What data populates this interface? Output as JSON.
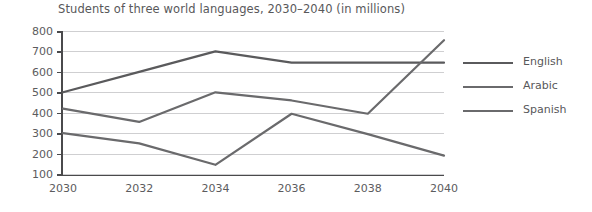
{
  "chart_data": {
    "type": "line",
    "title": "Students of three world languages, 2030–2040 (in millions)",
    "xlabel": "",
    "ylabel": "",
    "categories": [
      "2030",
      "2032",
      "2034",
      "2036",
      "2038",
      "2040"
    ],
    "x": [
      2030,
      2032,
      2034,
      2036,
      2038,
      2040
    ],
    "ylim": [
      100,
      800
    ],
    "yticks": [
      100,
      200,
      300,
      400,
      500,
      600,
      700,
      800
    ],
    "grid": "horizontal",
    "legend_position": "right",
    "series": [
      {
        "name": "English",
        "color": "#5a5a5c",
        "values": [
          500,
          600,
          700,
          645,
          645,
          645
        ]
      },
      {
        "name": "Arabic",
        "color": "#6a6a6c",
        "values": [
          420,
          355,
          500,
          460,
          395,
          755
        ]
      },
      {
        "name": "Spanish",
        "color": "#6a6a6c",
        "values": [
          300,
          250,
          145,
          395,
          295,
          190
        ]
      }
    ]
  },
  "legend": {
    "items": [
      {
        "label": "English"
      },
      {
        "label": "Arabic"
      },
      {
        "label": "Spanish"
      }
    ]
  },
  "colors": {
    "axis": "#4a4a4c",
    "grid": "#cfcfd1",
    "text": "#58585a",
    "line_english": "#5a5a5c",
    "line_arabic": "#6a6a6c",
    "line_spanish": "#6a6a6c",
    "background": "#ffffff"
  }
}
